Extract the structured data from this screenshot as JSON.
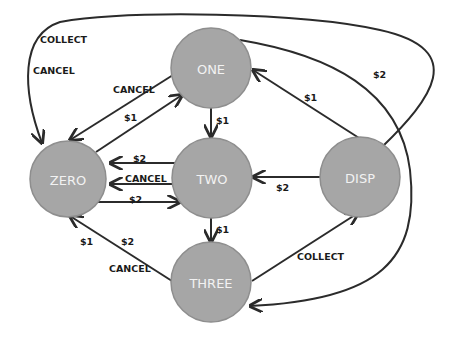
{
  "diagram": {
    "type": "state-machine",
    "colors": {
      "node_fill": "#a6a6a6",
      "node_stroke": "#8e8e8e",
      "node_text": "#f2f2f2",
      "edge": "#2b2b2b",
      "label": "#1a1a1a"
    },
    "nodes": [
      {
        "id": "ONE",
        "label": "ONE",
        "cx": 211,
        "cy": 68,
        "r": 40
      },
      {
        "id": "ZERO",
        "label": "ZERO",
        "cx": 68,
        "cy": 179,
        "r": 38
      },
      {
        "id": "TWO",
        "label": "TWO",
        "cx": 212,
        "cy": 178,
        "r": 40
      },
      {
        "id": "DISP",
        "label": "DISP",
        "cx": 360,
        "cy": 177,
        "r": 40
      },
      {
        "id": "THREE",
        "label": "THREE",
        "cx": 211,
        "cy": 282,
        "r": 40
      }
    ],
    "edges": [
      {
        "from": "ONE",
        "to": "ZERO",
        "labels": [
          "CANCEL"
        ]
      },
      {
        "from": "ZERO",
        "to": "ONE",
        "labels": [
          "$1"
        ]
      },
      {
        "from": "ONE",
        "to": "TWO",
        "labels": [
          "$1"
        ]
      },
      {
        "from": "TWO",
        "to": "ZERO",
        "labels": [
          "$2"
        ]
      },
      {
        "from": "TWO",
        "to": "ZERO",
        "labels": [
          "CANCEL"
        ]
      },
      {
        "from": "ZERO",
        "to": "TWO",
        "labels": [
          "$2"
        ]
      },
      {
        "from": "TWO",
        "to": "THREE",
        "labels": [
          "$1"
        ]
      },
      {
        "from": "THREE",
        "to": "ZERO",
        "labels": [
          "$1",
          "$2",
          "CANCEL"
        ]
      },
      {
        "from": "THREE",
        "to": "DISP",
        "labels": [
          "COLLECT"
        ]
      },
      {
        "from": "DISP",
        "to": "TWO",
        "labels": [
          "$2"
        ]
      },
      {
        "from": "DISP",
        "to": "ONE",
        "labels": [
          "$1"
        ]
      },
      {
        "from": "ONE",
        "to": "THREE",
        "labels": [
          "$2"
        ]
      },
      {
        "from": "DISP",
        "to": "ZERO",
        "labels": [
          "COLLECT",
          "CANCEL"
        ]
      }
    ]
  },
  "nodes": {
    "one": "ONE",
    "zero": "ZERO",
    "two": "TWO",
    "disp": "DISP",
    "three": "THREE"
  },
  "labels": {
    "disp_zero_collect": "COLLECT",
    "disp_zero_cancel": "CANCEL",
    "one_zero_cancel": "CANCEL",
    "zero_one_1": "$1",
    "one_two_1": "$1",
    "two_zero_2": "$2",
    "two_zero_cancel": "CANCEL",
    "zero_two_2": "$2",
    "two_three_1": "$1",
    "three_zero_1": "$1",
    "three_zero_2": "$2",
    "three_zero_cancel": "CANCEL",
    "three_disp_collect": "COLLECT",
    "disp_two_2": "$2",
    "disp_one_1": "$1",
    "one_three_2": "$2"
  }
}
